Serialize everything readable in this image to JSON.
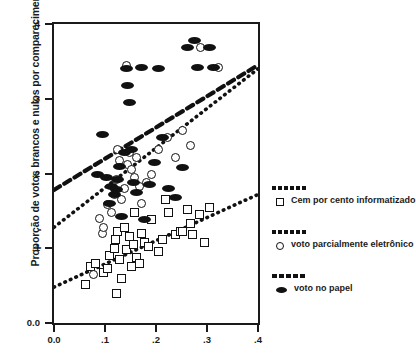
{
  "chart_data": {
    "type": "scatter",
    "title": "",
    "ylabel": "Proporção de votos brancos e nulos por comparecimento",
    "xlabel": "",
    "xlim": [
      0.0,
      0.4
    ],
    "ylim": [
      0.0,
      0.4
    ],
    "xticks": [
      "0.0",
      ".1",
      ".2",
      ".3",
      ".4"
    ],
    "xtick_values": [
      0.0,
      0.1,
      0.2,
      0.3,
      0.4
    ],
    "yticks": [
      "0.0",
      ".1",
      ".2",
      ".3",
      ".4"
    ],
    "ytick_values": [
      0.0,
      0.1,
      0.2,
      0.3,
      0.4
    ],
    "grid": false,
    "legend_position": "right",
    "series": [
      {
        "name": "Cem por cento informatizado",
        "marker": "open-square",
        "trendline": "dotted",
        "points": [
          [
            0.062,
            0.052
          ],
          [
            0.072,
            0.075
          ],
          [
            0.082,
            0.08
          ],
          [
            0.098,
            0.068
          ],
          [
            0.105,
            0.073
          ],
          [
            0.108,
            0.09
          ],
          [
            0.118,
            0.1
          ],
          [
            0.12,
            0.112
          ],
          [
            0.122,
            0.04
          ],
          [
            0.125,
            0.123
          ],
          [
            0.128,
            0.085
          ],
          [
            0.132,
            0.06
          ],
          [
            0.138,
            0.128
          ],
          [
            0.142,
            0.098
          ],
          [
            0.148,
            0.116
          ],
          [
            0.152,
            0.075
          ],
          [
            0.155,
            0.105
          ],
          [
            0.158,
            0.148
          ],
          [
            0.162,
            0.088
          ],
          [
            0.168,
            0.08
          ],
          [
            0.172,
            0.12
          ],
          [
            0.178,
            0.108
          ],
          [
            0.185,
            0.102
          ],
          [
            0.192,
            0.138
          ],
          [
            0.205,
            0.095
          ],
          [
            0.212,
            0.112
          ],
          [
            0.218,
            0.165
          ],
          [
            0.225,
            0.148
          ],
          [
            0.238,
            0.118
          ],
          [
            0.248,
            0.122
          ],
          [
            0.252,
            0.123
          ],
          [
            0.262,
            0.152
          ],
          [
            0.268,
            0.133
          ],
          [
            0.272,
            0.118
          ],
          [
            0.285,
            0.145
          ],
          [
            0.295,
            0.108
          ],
          [
            0.305,
            0.155
          ]
        ]
      },
      {
        "name": "voto parcialmente eletrônico",
        "marker": "open-circle",
        "trendline": "dotted",
        "points": [
          [
            0.078,
            0.065
          ],
          [
            0.09,
            0.14
          ],
          [
            0.095,
            0.12
          ],
          [
            0.098,
            0.128
          ],
          [
            0.105,
            0.158
          ],
          [
            0.112,
            0.148
          ],
          [
            0.118,
            0.172
          ],
          [
            0.122,
            0.192
          ],
          [
            0.125,
            0.232
          ],
          [
            0.128,
            0.218
          ],
          [
            0.132,
            0.165
          ],
          [
            0.138,
            0.18
          ],
          [
            0.142,
            0.345
          ],
          [
            0.145,
            0.212
          ],
          [
            0.148,
            0.228
          ],
          [
            0.152,
            0.205
          ],
          [
            0.158,
            0.195
          ],
          [
            0.162,
            0.222
          ],
          [
            0.168,
            0.182
          ],
          [
            0.172,
            0.16
          ],
          [
            0.182,
            0.188
          ],
          [
            0.192,
            0.198
          ],
          [
            0.205,
            0.232
          ],
          [
            0.222,
            0.248
          ],
          [
            0.238,
            0.222
          ],
          [
            0.252,
            0.258
          ],
          [
            0.268,
            0.238
          ],
          [
            0.288,
            0.368
          ],
          [
            0.322,
            0.342
          ]
        ]
      },
      {
        "name": "voto no papel",
        "marker": "filled-oval",
        "trendline": "dashed",
        "points": [
          [
            0.085,
            0.198
          ],
          [
            0.095,
            0.252
          ],
          [
            0.102,
            0.195
          ],
          [
            0.108,
            0.16
          ],
          [
            0.112,
            0.182
          ],
          [
            0.118,
            0.172
          ],
          [
            0.122,
            0.178
          ],
          [
            0.125,
            0.192
          ],
          [
            0.128,
            0.21
          ],
          [
            0.132,
            0.142
          ],
          [
            0.138,
            0.228
          ],
          [
            0.142,
            0.34
          ],
          [
            0.145,
            0.318
          ],
          [
            0.148,
            0.295
          ],
          [
            0.152,
            0.232
          ],
          [
            0.155,
            0.188
          ],
          [
            0.162,
            0.175
          ],
          [
            0.172,
            0.342
          ],
          [
            0.178,
            0.138
          ],
          [
            0.188,
            0.185
          ],
          [
            0.198,
            0.215
          ],
          [
            0.205,
            0.34
          ],
          [
            0.212,
            0.248
          ],
          [
            0.225,
            0.18
          ],
          [
            0.238,
            0.168
          ],
          [
            0.252,
            0.208
          ],
          [
            0.262,
            0.368
          ],
          [
            0.275,
            0.378
          ],
          [
            0.282,
            0.342
          ],
          [
            0.305,
            0.368
          ],
          [
            0.312,
            0.342
          ]
        ]
      }
    ],
    "trendlines": [
      {
        "series": "voto no papel",
        "style": "dashed",
        "x0": 0.0,
        "y0": 0.178,
        "x1": 0.4,
        "y1": 0.345
      },
      {
        "series": "voto parcialmente eletrônico",
        "style": "dotted",
        "x0": 0.0,
        "y0": 0.128,
        "x1": 0.4,
        "y1": 0.34
      },
      {
        "series": "Cem por cento informatizado",
        "style": "dotted",
        "x0": 0.0,
        "y0": 0.048,
        "x1": 0.4,
        "y1": 0.172
      }
    ]
  },
  "legend": {
    "items": [
      {
        "label": "Cem por cento informatizado",
        "marker": "open-square"
      },
      {
        "label": "voto parcialmente eletrônico",
        "marker": "open-circle"
      },
      {
        "label": "voto no papel",
        "marker": "filled-oval"
      }
    ]
  }
}
